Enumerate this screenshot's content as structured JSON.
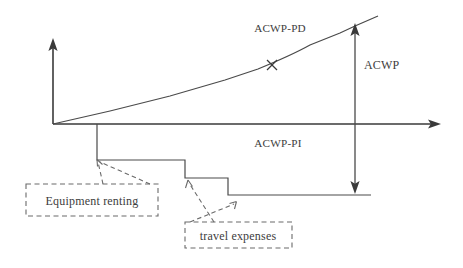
{
  "figure": {
    "title": "",
    "background_color": "#ffffff",
    "line_color": "#4a4a4a",
    "callout_color": "#6a6a6a"
  },
  "axes": {
    "origin": {
      "x": 53,
      "y": 124
    },
    "y_axis": {
      "top_y": 42,
      "bottom_y": 124,
      "arrow": "up",
      "label": ""
    },
    "x_axis": {
      "left_x": 53,
      "right_x": 440,
      "arrow": "right",
      "label": ""
    }
  },
  "series": [
    {
      "name": "ACWP-PD",
      "label": "ACWP-PD",
      "label_x": 280,
      "label_y": 32,
      "type": "line",
      "description": "progressively rising cumulative cost curve above the time axis",
      "points": [
        {
          "x": 53,
          "y": 124
        },
        {
          "x": 110,
          "y": 111
        },
        {
          "x": 170,
          "y": 96
        },
        {
          "x": 225,
          "y": 80
        },
        {
          "x": 258,
          "y": 69
        },
        {
          "x": 300,
          "y": 52
        },
        {
          "x": 340,
          "y": 33
        },
        {
          "x": 355,
          "y": 26
        },
        {
          "x": 378,
          "y": 16
        }
      ],
      "marker": {
        "symbol": "x",
        "x": 272,
        "y": 65
      }
    },
    {
      "name": "ACWP-PI",
      "label": "ACWP-PI",
      "label_x": 278,
      "label_y": 147,
      "type": "step",
      "description": "descending step function below the time axis representing indirect costs",
      "points": [
        {
          "x": 97,
          "y": 124
        },
        {
          "x": 97,
          "y": 160
        },
        {
          "x": 185,
          "y": 160
        },
        {
          "x": 185,
          "y": 178
        },
        {
          "x": 228,
          "y": 178
        },
        {
          "x": 228,
          "y": 195
        },
        {
          "x": 371,
          "y": 195
        }
      ]
    }
  ],
  "measures": [
    {
      "name": "ACWP",
      "label": "ACWP",
      "label_x": 364,
      "label_y": 69,
      "type": "double-headed-arrow",
      "x": 355,
      "top_y": 25,
      "bottom_y": 192
    }
  ],
  "callouts": [
    {
      "name": "equipment-renting",
      "label": "Equipment renting",
      "box": {
        "x": 26,
        "y": 184,
        "width": 132,
        "height": 32
      },
      "text_x": 92,
      "text_y": 204,
      "leaders": [
        {
          "from_x": 103,
          "from_y": 184,
          "to_x": 98,
          "to_y": 161
        },
        {
          "from_x": 150,
          "from_y": 184,
          "to_x": 99,
          "to_y": 161
        }
      ],
      "arrow_targets": [
        {
          "x": 97,
          "y": 160
        }
      ]
    },
    {
      "name": "travel-expenses",
      "label": "travel expenses",
      "box": {
        "x": 185,
        "y": 222,
        "width": 107,
        "height": 26
      },
      "text_x": 238,
      "text_y": 239,
      "leaders": [
        {
          "from_x": 214,
          "from_y": 222,
          "to_x": 188,
          "to_y": 181
        },
        {
          "from_x": 190,
          "from_y": 222,
          "to_x": 236,
          "to_y": 203
        }
      ],
      "arrow_targets": [
        {
          "x": 188,
          "y": 180
        },
        {
          "x": 236,
          "y": 202
        }
      ]
    }
  ]
}
